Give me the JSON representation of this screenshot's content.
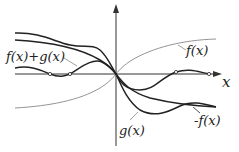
{
  "diagram": {
    "axes": {
      "x_label": "x",
      "origin": [
        116,
        74
      ]
    },
    "labels": {
      "f": "f(x)",
      "neg_f": "-f(x)",
      "g": "g(x)",
      "sum": "f(x)+g(x)"
    },
    "colors": {
      "axis": "#333333",
      "thin_curve": "#888888",
      "thick_curve": "#222222"
    }
  }
}
